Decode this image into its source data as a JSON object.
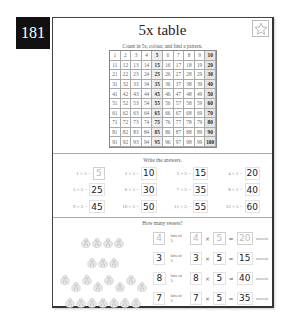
{
  "page": {
    "number": "181"
  },
  "header": {
    "title": "5x table",
    "star_icon": "star-outline-icon"
  },
  "grid_section": {
    "instruction": "Count in 5s, colour, and find a pattern.",
    "numbers": [
      [
        1,
        2,
        3,
        4,
        5,
        6,
        7,
        8,
        9,
        10
      ],
      [
        11,
        12,
        13,
        14,
        15,
        16,
        17,
        18,
        19,
        20
      ],
      [
        21,
        22,
        23,
        24,
        25,
        26,
        27,
        28,
        29,
        30
      ],
      [
        31,
        32,
        33,
        34,
        35,
        36,
        37,
        38,
        39,
        40
      ],
      [
        41,
        42,
        43,
        44,
        45,
        46,
        47,
        48,
        49,
        50
      ],
      [
        51,
        52,
        53,
        54,
        55,
        56,
        57,
        58,
        59,
        60
      ],
      [
        61,
        62,
        63,
        64,
        65,
        66,
        67,
        68,
        69,
        70
      ],
      [
        71,
        72,
        73,
        74,
        75,
        76,
        77,
        78,
        79,
        80
      ],
      [
        81,
        82,
        83,
        84,
        85,
        86,
        87,
        88,
        89,
        90
      ],
      [
        91,
        92,
        93,
        94,
        95,
        96,
        97,
        98,
        99,
        100
      ]
    ],
    "highlight_columns": [
      5,
      10
    ],
    "highlight_color": "#eeeeee"
  },
  "answers_section": {
    "instruction": "Write the answers.",
    "items": [
      {
        "question": "1 × 5 =",
        "answer": "5",
        "example": true
      },
      {
        "question": "2 × 5 =",
        "answer": "10"
      },
      {
        "question": "3 × 5 =",
        "answer": "15"
      },
      {
        "question": "4 × 5 =",
        "answer": "20"
      },
      {
        "question": "5 × 5 =",
        "answer": "25"
      },
      {
        "question": "6 × 5 =",
        "answer": "30"
      },
      {
        "question": "7 × 5 =",
        "answer": "35"
      },
      {
        "question": "8 × 5 =",
        "answer": "40"
      },
      {
        "question": "9 × 5 =",
        "answer": "45"
      },
      {
        "question": "10 × 5 =",
        "answer": "50"
      },
      {
        "question": "11 × 5 =",
        "answer": "55"
      },
      {
        "question": "12 × 5 =",
        "answer": "60"
      }
    ]
  },
  "sweets_section": {
    "instruction": "How many sweets?",
    "lots_label": "lots of 5",
    "times_sign": "×",
    "equals_sign": "=",
    "unit_label": "sweets",
    "rows": [
      {
        "bags": 4,
        "lots": "4",
        "a": "4",
        "b": "5",
        "result": "20",
        "example": true,
        "stagger": false
      },
      {
        "bags": 3,
        "lots": "3",
        "a": "3",
        "b": "5",
        "result": "15",
        "stagger": false
      },
      {
        "bags": 8,
        "lots": "8",
        "a": "8",
        "b": "5",
        "result": "40",
        "stagger": true
      },
      {
        "bags": 7,
        "lots": "7",
        "a": "7",
        "b": "5",
        "result": "35",
        "stagger": false
      }
    ]
  }
}
